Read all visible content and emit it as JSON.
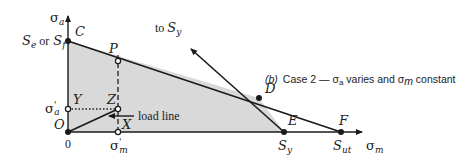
{
  "diagram": {
    "caption": {
      "tag": "(b)",
      "text_prefix": "Case 2 — ",
      "sigma_a": "σ",
      "sigma_a_sub": "a",
      "middle": " varies and ",
      "sigma_m": "σ",
      "sigma_m_sub": "m",
      "suffix": " constant"
    },
    "axes": {
      "y_label": "σ",
      "y_label_sub": "a",
      "x_label": "σ",
      "x_label_sub": "m",
      "origin_tick": "0"
    },
    "labels": {
      "se_or_sf_Se": "S",
      "se_or_sf_Se_sub": "e",
      "se_or_sf_or": "or",
      "se_or_sf_Sf": "S",
      "se_or_sf_Sf_sub": "f",
      "sigma_a_prime": "σ",
      "sigma_a_prime_sup": "'",
      "sigma_a_prime_sub": "a",
      "sigma_m_prime": "σ",
      "sigma_m_prime_sup": "'",
      "sigma_m_prime_sub": "m",
      "sy_label": "S",
      "sy_label_sub": "y",
      "sut_label": "S",
      "sut_label_sub": "ut",
      "to_sy_prefix": "to ",
      "to_sy": "S",
      "to_sy_sub": "y",
      "load_line": "load line"
    },
    "points": {
      "C": "C",
      "P": "P",
      "Z": "Z",
      "Y": "Y",
      "X": "X",
      "O": "O",
      "D": "D",
      "E": "E",
      "F": "F"
    },
    "colors": {
      "line": "#1a1a1a",
      "fill": "#d9d9d9",
      "background": "#ffffff"
    }
  }
}
